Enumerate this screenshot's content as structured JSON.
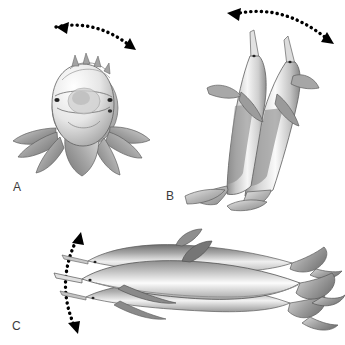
{
  "figure": {
    "background_color": "#ffffff",
    "ink_color": "#000000",
    "label_color": "#3b3b3b",
    "body_gray_light": "#f2f2f2",
    "body_gray_mid": "#b9b9b9",
    "body_gray_dark": "#6e6e6e",
    "outline_gray": "#555555"
  },
  "panels": [
    {
      "id": "A",
      "label": "A",
      "label_x": 13,
      "label_y": 186,
      "view": "frontal-view",
      "subject": "dolphin-head-frontal",
      "description": "Frontal view of a spinner dolphin head with pectoral flippers fanned out, drawn as several superimposed rotational positions",
      "arrow": {
        "name": "rotation-arrow-a",
        "style": "dotted-double-headed-curve",
        "orientation": "horizontal-arc",
        "from_x": 48,
        "from_y": 26,
        "to_x": 136,
        "to_y": 49,
        "control_x": 95,
        "control_y": 22
      }
    },
    {
      "id": "B",
      "label": "B",
      "label_x": 166,
      "label_y": 196,
      "view": "lateral-view",
      "subject": "dolphin-vertical-pair",
      "description": "Two superimposed vertical nose-up dolphins forming a V, tails and flukes at the bottom",
      "arrow": {
        "name": "rotation-arrow-b",
        "style": "dotted-double-headed-curve",
        "orientation": "horizontal-arc",
        "from_x": 228,
        "from_y": 13,
        "to_x": 332,
        "to_y": 43,
        "control_x": 282,
        "control_y": 8
      }
    },
    {
      "id": "C",
      "label": "C",
      "label_x": 12,
      "label_y": 323,
      "view": "dorsal-longitudinal-view",
      "subject": "dolphin-horizontal-triple",
      "description": "Three superimposed horizontal dolphins facing left, tails fanning to the right, showing longitudinal-axis spin",
      "arrow": {
        "name": "rotation-arrow-c",
        "style": "dotted-double-headed-curve",
        "orientation": "vertical-arc",
        "from_x": 80,
        "from_y": 233,
        "to_x": 79,
        "to_y": 332,
        "control_x": 63,
        "control_y": 283
      }
    }
  ]
}
